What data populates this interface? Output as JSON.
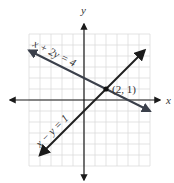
{
  "chart_data": {
    "type": "line",
    "title": "",
    "xlabel": "x",
    "ylabel": "y",
    "xlim": [
      -5,
      6
    ],
    "ylim": [
      -6,
      6
    ],
    "grid": true,
    "series": [
      {
        "name": "x + 2y = 4",
        "label": "x + 2y = 4",
        "slope": -0.5,
        "intercept": 2,
        "x": [
          -5,
          6
        ],
        "y": [
          4.5,
          -1
        ]
      },
      {
        "name": "x − y = 1",
        "label": "x − y = 1",
        "slope": 1,
        "intercept": -1,
        "x": [
          -4,
          5.5
        ],
        "y": [
          -5,
          4.5
        ]
      }
    ],
    "annotations": [
      {
        "text": "(2, 1)",
        "x": 2,
        "y": 1,
        "type": "intersection-point"
      }
    ]
  },
  "colors": {
    "line1": "#3a3f4a",
    "line2": "#1f1f1f",
    "axis": "#1a1a1a",
    "grid": "#dcdcdc"
  }
}
